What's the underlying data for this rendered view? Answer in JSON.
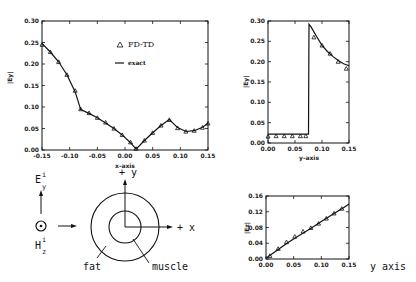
{
  "chart_data": [
    {
      "type": "line",
      "title": "",
      "xlabel": "x-axis",
      "ylabel": "|Ey|",
      "xlim": [
        -0.15,
        0.15
      ],
      "ylim": [
        0.0,
        0.3
      ],
      "xticks": [
        "-0.15",
        "-0.10",
        "-0.05",
        "0.00",
        "0.05",
        "0.10",
        "0.15"
      ],
      "yticks": [
        "0.00",
        "0.05",
        "0.10",
        "0.15",
        "0.20",
        "0.25",
        "0.30"
      ],
      "legend": [
        "FD-TD",
        "exact"
      ],
      "series": [
        {
          "name": "exact",
          "x": [
            -0.15,
            -0.135,
            -0.12,
            -0.105,
            -0.09,
            -0.08,
            -0.065,
            -0.05,
            -0.035,
            -0.02,
            -0.005,
            0.01,
            0.02,
            0.035,
            0.05,
            0.065,
            0.08,
            0.095,
            0.11,
            0.125,
            0.14,
            0.15
          ],
          "y": [
            0.248,
            0.228,
            0.205,
            0.175,
            0.135,
            0.094,
            0.085,
            0.075,
            0.063,
            0.05,
            0.035,
            0.017,
            0.002,
            0.022,
            0.04,
            0.057,
            0.071,
            0.052,
            0.043,
            0.045,
            0.053,
            0.062
          ]
        },
        {
          "name": "FD-TD",
          "x": [
            -0.15,
            -0.135,
            -0.12,
            -0.105,
            -0.09,
            -0.08,
            -0.065,
            -0.05,
            -0.035,
            -0.02,
            -0.005,
            0.01,
            0.02,
            0.035,
            0.05,
            0.065,
            0.08,
            0.095,
            0.11,
            0.125,
            0.14,
            0.15
          ],
          "y": [
            0.245,
            0.228,
            0.205,
            0.175,
            0.138,
            0.095,
            0.086,
            0.075,
            0.064,
            0.05,
            0.035,
            0.018,
            0.003,
            0.022,
            0.04,
            0.057,
            0.07,
            0.051,
            0.043,
            0.045,
            0.052,
            0.062
          ]
        }
      ]
    },
    {
      "type": "line",
      "title": "",
      "xlabel": "y-axis",
      "ylabel": "|Ey|",
      "xlim": [
        0.0,
        0.15
      ],
      "ylim": [
        0.0,
        0.3
      ],
      "xticks": [
        "0.00",
        "0.05",
        "0.10",
        "0.15"
      ],
      "yticks": [
        "0.00",
        "0.05",
        "0.10",
        "0.15",
        "0.20",
        "0.25",
        "0.30"
      ],
      "series": [
        {
          "name": "exact",
          "x": [
            0.0,
            0.02,
            0.04,
            0.06,
            0.075,
            0.076,
            0.08,
            0.09,
            0.1,
            0.11,
            0.12,
            0.13,
            0.14,
            0.15
          ],
          "y": [
            0.022,
            0.022,
            0.022,
            0.022,
            0.022,
            0.292,
            0.285,
            0.262,
            0.24,
            0.225,
            0.213,
            0.203,
            0.195,
            0.19
          ]
        },
        {
          "name": "FD-TD",
          "x": [
            0.0,
            0.015,
            0.03,
            0.045,
            0.06,
            0.07,
            0.085,
            0.1,
            0.115,
            0.13,
            0.145
          ],
          "y": [
            0.016,
            0.017,
            0.017,
            0.017,
            0.017,
            0.017,
            0.26,
            0.24,
            0.22,
            0.2,
            0.183
          ]
        }
      ]
    },
    {
      "type": "line",
      "title": "",
      "xlabel": "y axis",
      "ylabel": "|Ez|",
      "xlim": [
        0.0,
        0.15
      ],
      "ylim": [
        0.0,
        0.16
      ],
      "xticks": [
        "0.00",
        "0.05",
        "0.10",
        "0.15"
      ],
      "yticks": [
        "0.00",
        "0.04",
        "0.08",
        "0.12",
        "0.16"
      ],
      "series": [
        {
          "name": "exact",
          "x": [
            0.0,
            0.02,
            0.04,
            0.06,
            0.08,
            0.1,
            0.12,
            0.14,
            0.15
          ],
          "y": [
            0.002,
            0.022,
            0.042,
            0.06,
            0.077,
            0.095,
            0.113,
            0.13,
            0.14
          ]
        },
        {
          "name": "FD-TD",
          "x": [
            0.007,
            0.022,
            0.037,
            0.052,
            0.067,
            0.081,
            0.095,
            0.109,
            0.123,
            0.137
          ],
          "y": [
            0.008,
            0.026,
            0.043,
            0.057,
            0.07,
            0.079,
            0.09,
            0.103,
            0.116,
            0.128
          ]
        }
      ]
    }
  ],
  "diagram": {
    "e_label": "E",
    "e_sup": "i",
    "e_sub": "y",
    "h_label": "H",
    "h_sup": "i",
    "h_sub": "z",
    "plus_y": "+ y",
    "plus_x": "+ x",
    "fat": "fat",
    "muscle": "muscle"
  },
  "labels": {
    "legend_fdtd": "FD-TD",
    "legend_exact": "exact",
    "x_axis_1": "x-axis",
    "x_axis_2": "y-axis",
    "x_axis_3": "y axis",
    "y_axis_1": "|Ey|",
    "y_axis_2": "|Ey|",
    "y_axis_3": "|Ez|"
  }
}
